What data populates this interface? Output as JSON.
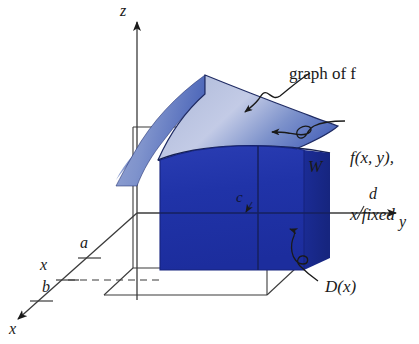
{
  "figure": {
    "axes": {
      "z_label": "z",
      "y_label": "y",
      "x_label": "x"
    },
    "ticks": {
      "a": "a",
      "b": "b",
      "x_fixed": "x",
      "c": "c",
      "d": "d"
    },
    "annotations": {
      "graph_of_f": "graph of f",
      "cross_section_line1": "f(x, y),",
      "cross_section_line2": "x fixed",
      "region_W": "W",
      "region_Dx": "D(x)"
    },
    "colors": {
      "surface_light": "#aebadb",
      "surface_mid": "#5a74c0",
      "slab_dark": "#2033a8",
      "slab_side": "#1b2c96",
      "ink": "#1a1a1a",
      "background": "#ffffff"
    }
  }
}
